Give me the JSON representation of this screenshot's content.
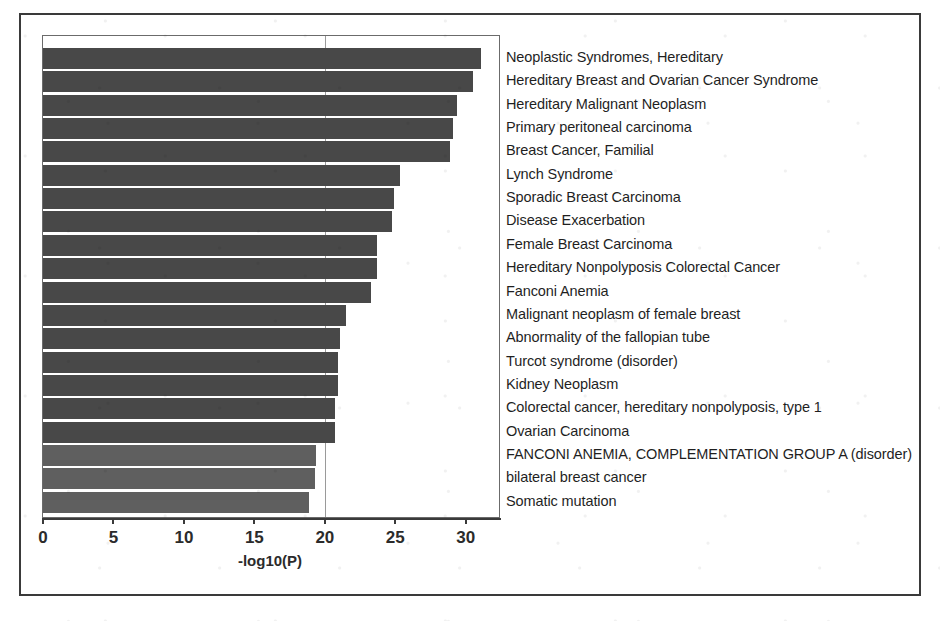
{
  "figure": {
    "x_axis_title": "-log10(P)",
    "bar_color_dark": "#454545",
    "bar_color_light": "#5c5c5c",
    "axis_color": "#3a3a3a",
    "grid_color": "#9a9a9a"
  },
  "chart_data": {
    "type": "bar",
    "orientation": "horizontal",
    "title": "",
    "xlabel": "-log10(P)",
    "ylabel": "",
    "xlim": [
      0,
      32.5
    ],
    "grid": true,
    "gridlines": [
      20
    ],
    "legend": "none",
    "tick_labels": [
      "0",
      "5",
      "10",
      "15",
      "20",
      "25",
      "30"
    ],
    "ticks": [
      0,
      5,
      10,
      15,
      20,
      25,
      30
    ],
    "categories": [
      "Neoplastic Syndromes, Hereditary",
      "Hereditary Breast and Ovarian Cancer Syndrome",
      "Hereditary Malignant Neoplasm",
      "Primary peritoneal carcinoma",
      "Breast Cancer, Familial",
      "Lynch Syndrome",
      "Sporadic Breast Carcinoma",
      "Disease Exacerbation",
      "Female Breast Carcinoma",
      "Hereditary Nonpolyposis Colorectal Cancer",
      "Fanconi Anemia",
      "Malignant neoplasm of female breast",
      "Abnormality of the fallopian tube",
      "Turcot syndrome (disorder)",
      "Kidney Neoplasm",
      "Colorectal cancer, hereditary nonpolyposis, type 1",
      "Ovarian Carcinoma",
      "FANCONI ANEMIA, COMPLEMENTATION GROUP A (disorder)",
      "bilateral breast cancer",
      "Somatic mutation"
    ],
    "values": [
      31.1,
      30.5,
      29.4,
      29.1,
      28.9,
      25.3,
      24.9,
      24.8,
      23.7,
      23.7,
      23.3,
      21.5,
      21.1,
      20.9,
      20.9,
      20.7,
      20.7,
      19.4,
      19.3,
      18.9
    ],
    "shades": [
      "dark",
      "dark",
      "dark",
      "dark",
      "dark",
      "dark",
      "dark",
      "dark",
      "dark",
      "dark",
      "dark",
      "dark",
      "dark",
      "dark",
      "dark",
      "dark",
      "dark",
      "light",
      "light",
      "light"
    ]
  }
}
